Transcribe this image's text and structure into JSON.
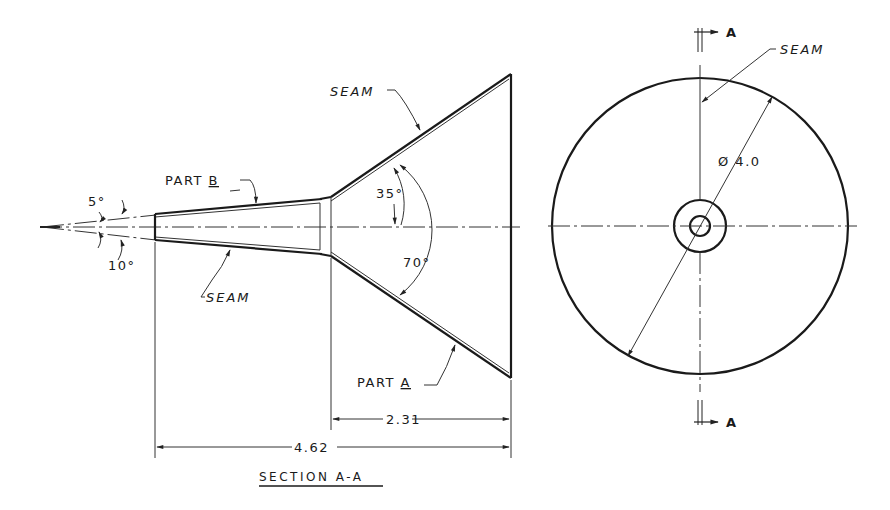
{
  "drawing": {
    "title": "SECTION A-A",
    "section_view": {
      "labels": {
        "part_a": "PART",
        "part_a_letter": "A",
        "part_b": "PART",
        "part_b_letter": "B",
        "seam_top": "SEAM",
        "seam_bottom": "SEAM"
      },
      "angles": {
        "half_taper": "5°",
        "taper": "10°",
        "cone_half": "35°",
        "cone_full": "70°"
      },
      "dimensions": {
        "part_a_length": "2.31",
        "overall_length": "4.62"
      }
    },
    "end_view": {
      "diameter": "Ø 4.0",
      "seam": "SEAM",
      "section_marker_top": "A",
      "section_marker_bottom": "A"
    }
  }
}
